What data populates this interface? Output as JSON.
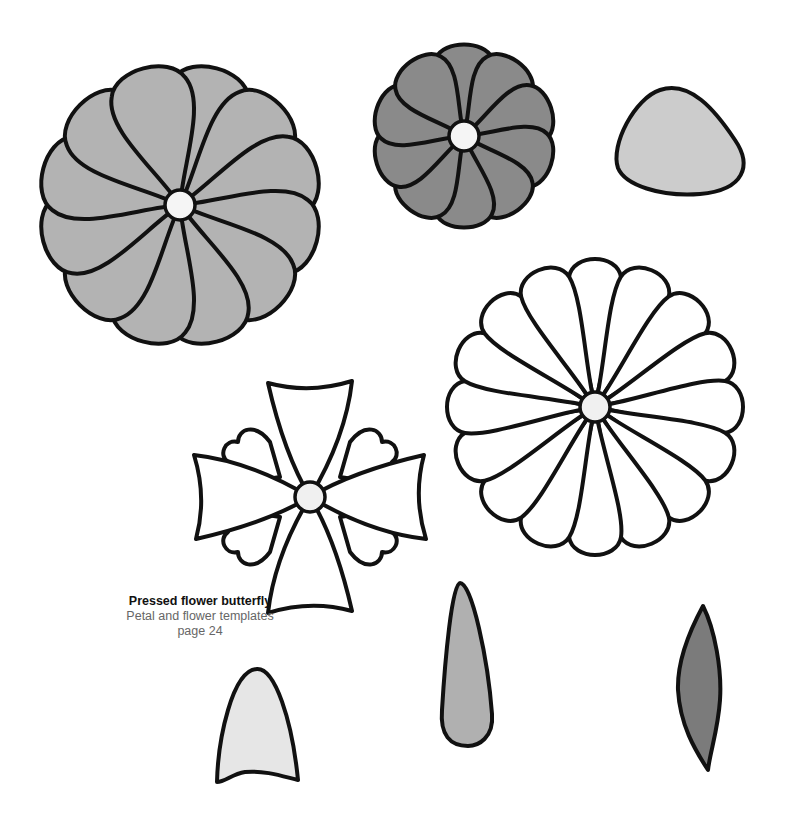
{
  "caption": {
    "title": "Pressed flower butterfly",
    "subtitle": "Petal and flower templates",
    "page": "page 24"
  },
  "colors": {
    "outline": "#111111",
    "petal_mid_gray": "#b3b3b3",
    "petal_dark_gray": "#8a8a8a",
    "petal_light_gray": "#cccccc",
    "petal_very_light": "#e6e6e6",
    "leaf_dark": "#7b7b7b",
    "center_fill": "#f5f5f5",
    "white": "#ffffff"
  },
  "templates": [
    {
      "id": "large-12-petal-flower",
      "petals": 12,
      "fill": "mid-gray",
      "cx": 180,
      "cy": 205,
      "r": 148
    },
    {
      "id": "small-10-petal-flower",
      "petals": 10,
      "fill": "dark-gray",
      "cx": 464,
      "cy": 136,
      "r": 92
    },
    {
      "id": "rounded-triangle-petal",
      "fill": "light-gray",
      "cx": 680,
      "cy": 143
    },
    {
      "id": "daisy-16-petal-flower",
      "petals": 16,
      "fill": "white",
      "cx": 595,
      "cy": 407,
      "r": 158
    },
    {
      "id": "four-petal-flower",
      "petals": 4,
      "fill": "white",
      "cx": 310,
      "cy": 497
    },
    {
      "id": "arch-petal",
      "fill": "very-light-gray",
      "cx": 258,
      "cy": 728
    },
    {
      "id": "teardrop-petal",
      "fill": "mid-gray",
      "cx": 470,
      "cy": 665
    },
    {
      "id": "leaf",
      "fill": "dark-gray",
      "cx": 700,
      "cy": 688
    }
  ]
}
